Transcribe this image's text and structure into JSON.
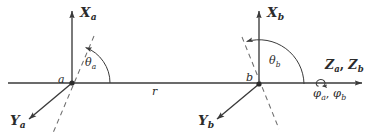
{
  "figure": {
    "background_color": "#ffffff",
    "line_color": "#3a3a3a",
    "dash_color": "#6e6e6e",
    "text_color": "#2b2b2b",
    "width": 374,
    "height": 136
  },
  "frame_a": {
    "origin_label": "a",
    "x_axis_label": "X",
    "x_axis_sub": "a",
    "y_axis_label": "Y",
    "y_axis_sub": "a",
    "angle_label": "θ",
    "angle_sub": "a"
  },
  "frame_b": {
    "origin_label": "b",
    "x_axis_label": "X",
    "x_axis_sub": "b",
    "y_axis_label": "Y",
    "y_axis_sub": "b",
    "angle_label": "θ",
    "angle_sub": "b"
  },
  "common_axis": {
    "z_label_a": "Z",
    "z_sub_a": "a",
    "z_separator": ", ",
    "z_label_b": "Z",
    "z_sub_b": "b",
    "phi_label_a": "φ",
    "phi_sub_a": "a",
    "phi_separator": ", ",
    "phi_label_b": "φ",
    "phi_sub_b": "b",
    "rotation_icon": "rotation-loop-icon"
  },
  "distance": {
    "label": "r"
  },
  "geometry": {
    "origin_a": {
      "x": 72,
      "y": 83
    },
    "origin_b": {
      "x": 259,
      "y": 84
    },
    "z_axis_y": 83,
    "z_axis_x_start": 8,
    "z_axis_x_end": 366,
    "theta_a_degrees": 70,
    "theta_b_degrees": 110
  }
}
